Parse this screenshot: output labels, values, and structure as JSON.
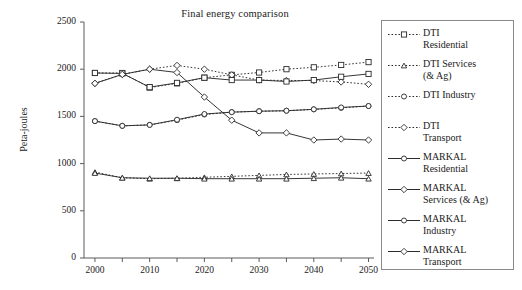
{
  "chart_data": {
    "type": "line",
    "title": "Final energy comparison",
    "xlabel": "",
    "ylabel": "Peta-joules",
    "xlim": [
      1998,
      2051
    ],
    "ylim": [
      0,
      2500
    ],
    "ytick_labels": [
      "0",
      "500",
      "1000",
      "1500",
      "2000",
      "2500"
    ],
    "ytick_values": [
      0,
      500,
      1000,
      1500,
      2000,
      2500
    ],
    "xtick_labels": [
      "2000",
      "2010",
      "2020",
      "2030",
      "2040",
      "2050"
    ],
    "xtick_values": [
      2000,
      2010,
      2020,
      2030,
      2040,
      2050
    ],
    "xminor_values": [
      2005,
      2015,
      2025,
      2035,
      2045
    ],
    "grid": false,
    "legend_position": "right-outside",
    "x": [
      2000,
      2005,
      2010,
      2015,
      2020,
      2025,
      2030,
      2035,
      2040,
      2045,
      2050
    ],
    "series": [
      {
        "name": "DTI Residential",
        "marker": "square",
        "linestyle": "dotted",
        "values": [
          1960,
          1960,
          1805,
          1850,
          1910,
          1940,
          1965,
          2000,
          2020,
          2045,
          2075
        ]
      },
      {
        "name": "DTI Services (& Ag)",
        "marker": "triangle",
        "linestyle": "dotted",
        "values": [
          910,
          850,
          840,
          845,
          855,
          865,
          875,
          885,
          890,
          895,
          900
        ]
      },
      {
        "name": "DTI Industry",
        "marker": "circle-small",
        "linestyle": "dotted",
        "values": [
          1450,
          1400,
          1410,
          1460,
          1520,
          1545,
          1555,
          1560,
          1575,
          1590,
          1610
        ]
      },
      {
        "name": "DTI Transport",
        "marker": "diamond",
        "linestyle": "dotted",
        "values": [
          1850,
          1945,
          2000,
          2040,
          2000,
          1940,
          1885,
          1880,
          1880,
          1865,
          1840
        ]
      },
      {
        "name": "MARKAL Residential",
        "marker": "square",
        "linestyle": "solid",
        "values": [
          1960,
          1955,
          1810,
          1855,
          1910,
          1885,
          1885,
          1870,
          1885,
          1920,
          1950
        ]
      },
      {
        "name": "MARKAL Services (& Ag)",
        "marker": "triangle",
        "linestyle": "solid",
        "values": [
          900,
          850,
          845,
          845,
          840,
          840,
          840,
          840,
          845,
          850,
          840
        ]
      },
      {
        "name": "MARKAL Industry",
        "marker": "circle-small",
        "linestyle": "solid",
        "values": [
          1450,
          1400,
          1410,
          1465,
          1525,
          1545,
          1555,
          1560,
          1575,
          1595,
          1610
        ]
      },
      {
        "name": "MARKAL Transport",
        "marker": "diamond",
        "linestyle": "solid",
        "values": [
          1850,
          1945,
          2000,
          1965,
          1705,
          1460,
          1325,
          1325,
          1250,
          1260,
          1250
        ]
      }
    ]
  },
  "legend": {
    "entries": [
      {
        "label_line1": "DTI",
        "label_line2": "Residential",
        "marker": "square",
        "linestyle": "dotted"
      },
      {
        "label_line1": "DTI Services",
        "label_line2": "(& Ag)",
        "marker": "triangle",
        "linestyle": "dotted"
      },
      {
        "label_line1": "DTI Industry",
        "label_line2": "",
        "marker": "circle-small",
        "linestyle": "dotted"
      },
      {
        "label_line1": "DTI",
        "label_line2": "Transport",
        "marker": "diamond",
        "linestyle": "dotted"
      },
      {
        "label_line1": "MARKAL",
        "label_line2": "Residential",
        "marker": "circle-small",
        "linestyle": "solid"
      },
      {
        "label_line1": "MARKAL",
        "label_line2": "Services (& Ag)",
        "marker": "diamond",
        "linestyle": "solid"
      },
      {
        "label_line1": "MARKAL",
        "label_line2": "Industry",
        "marker": "circle-small",
        "linestyle": "solid"
      },
      {
        "label_line1": "MARKAL",
        "label_line2": "Transport",
        "marker": "diamond",
        "linestyle": "solid"
      }
    ]
  },
  "colors": {
    "line": "#2b2b2b",
    "axis": "#5a5a5a",
    "text": "#1b1b1b",
    "legend_border": "#8a8a8a",
    "background": "#ffffff"
  }
}
